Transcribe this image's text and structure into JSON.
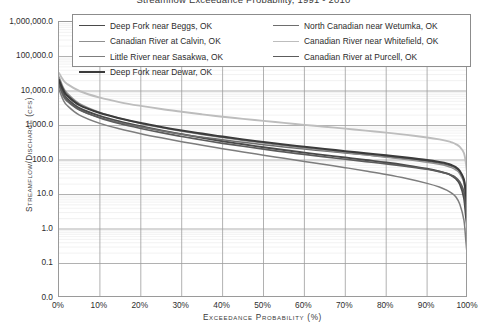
{
  "chart_data": {
    "type": "line",
    "title": "Streamflow Exceedance Probability, 1991 - 2010",
    "xlabel": "Exceedance Probability (%)",
    "ylabel": "Streamflow/Discharge (cfs)",
    "yscale": "log",
    "ylim": [
      0.0,
      1000000.0
    ],
    "xlim": [
      0,
      100
    ],
    "grid": true,
    "legend_position": "top-inside",
    "ytick_labels": [
      "1,000,000.0",
      "100,000.0",
      "10,000.0",
      "1,000.0",
      "100.0",
      "10.0",
      "1.0",
      "0.1",
      "0.0"
    ],
    "ytick_values": [
      1000000.0,
      100000.0,
      10000.0,
      1000.0,
      100.0,
      10.0,
      1.0,
      0.1,
      0.0
    ],
    "xtick_labels": [
      "0%",
      "10%",
      "20%",
      "30%",
      "40%",
      "50%",
      "60%",
      "70%",
      "80%",
      "90%",
      "100%"
    ],
    "xtick_values": [
      0,
      10,
      20,
      30,
      40,
      50,
      60,
      70,
      80,
      90,
      100
    ],
    "x": [
      0,
      1,
      2,
      5,
      10,
      15,
      20,
      25,
      30,
      35,
      40,
      45,
      50,
      55,
      60,
      65,
      70,
      75,
      80,
      85,
      90,
      93,
      95,
      96,
      97,
      98,
      99,
      99.5,
      100
    ],
    "series": [
      {
        "name": "Deep Fork near Beggs, OK",
        "color": "#4a4a4a",
        "width": 1.9,
        "values": [
          18000,
          9000,
          6000,
          3200,
          1900,
          1300,
          950,
          720,
          560,
          440,
          350,
          285,
          235,
          195,
          163,
          138,
          118,
          100,
          85,
          70,
          56,
          47,
          40,
          35,
          29,
          20,
          8,
          2.2,
          0.7
        ]
      },
      {
        "name": "North Canadian near Wetumka, OK",
        "color": "#6e6e6e",
        "width": 1.5,
        "values": [
          14000,
          7200,
          5000,
          2800,
          1700,
          1200,
          900,
          700,
          560,
          460,
          385,
          325,
          278,
          240,
          208,
          182,
          160,
          141,
          124,
          108,
          92,
          81,
          72,
          66,
          58,
          45,
          26,
          11,
          3.0
        ]
      },
      {
        "name": "Canadian River at Calvin, OK",
        "color": "#8f8f8f",
        "width": 1.5,
        "values": [
          26000,
          13000,
          8600,
          4300,
          2400,
          1600,
          1150,
          870,
          680,
          545,
          445,
          370,
          310,
          262,
          223,
          191,
          164,
          141,
          121,
          103,
          86,
          75,
          66,
          60,
          52,
          40,
          22,
          8,
          1.6
        ]
      },
      {
        "name": "Canadian River near Whitefield, OK",
        "color": "#bdbdbd",
        "width": 1.9,
        "values": [
          33000,
          21000,
          16000,
          10000,
          6400,
          4700,
          3700,
          3000,
          2500,
          2100,
          1800,
          1560,
          1360,
          1190,
          1045,
          920,
          810,
          710,
          620,
          535,
          450,
          395,
          352,
          325,
          290,
          240,
          160,
          78,
          22
        ]
      },
      {
        "name": "Little River near Sasakwa, OK",
        "color": "#7d7d7d",
        "width": 1.5,
        "values": [
          11000,
          5600,
          3800,
          2000,
          1150,
          790,
          580,
          440,
          340,
          268,
          213,
          171,
          138,
          112,
          91,
          74,
          60,
          48,
          38,
          29,
          21,
          16.5,
          13,
          11,
          8.6,
          5.2,
          1.8,
          0.42,
          0.09
        ]
      },
      {
        "name": "Canadian River at Purcell, OK",
        "color": "#5c5c5c",
        "width": 1.7,
        "values": [
          16000,
          8200,
          5500,
          2900,
          1650,
          1120,
          820,
          620,
          480,
          380,
          305,
          250,
          206,
          172,
          145,
          123,
          105,
          90,
          77,
          65,
          54,
          46,
          40,
          36,
          31,
          23,
          12,
          4.0,
          1.0
        ]
      },
      {
        "name": "Deep Fork near Dewar, OK",
        "color": "#3b3b3b",
        "width": 2.1,
        "values": [
          21000,
          11000,
          7400,
          3900,
          2300,
          1600,
          1180,
          910,
          720,
          580,
          475,
          395,
          332,
          282,
          241,
          208,
          180,
          156,
          136,
          117,
          99,
          87,
          78,
          71,
          62,
          48,
          27,
          10,
          2.5
        ]
      }
    ]
  },
  "legend": {
    "left_items": [
      {
        "label": "Deep Fork near Beggs, OK",
        "color": "#4a4a4a",
        "width": "1.9px"
      },
      {
        "label": "Canadian River at Calvin, OK",
        "color": "#8f8f8f",
        "width": "1.5px"
      },
      {
        "label": "Little River near Sasakwa, OK",
        "color": "#7d7d7d",
        "width": "1.5px"
      },
      {
        "label": "Deep Fork near Dewar, OK",
        "color": "#3b3b3b",
        "width": "2.1px"
      }
    ],
    "right_items": [
      {
        "label": "North Canadian near Wetumka, OK",
        "color": "#6e6e6e",
        "width": "1.5px"
      },
      {
        "label": "Canadian River near Whitefield, OK",
        "color": "#bdbdbd",
        "width": "1.9px"
      },
      {
        "label": "Canadian River at Purcell, OK",
        "color": "#5c5c5c",
        "width": "1.7px"
      }
    ]
  },
  "axes": {
    "title": "Streamflow Exceedance Probability, 1991 - 2010",
    "y_title": "Streamflow/Discharge (cfs)",
    "x_title": "Exceedance Probability (%)"
  },
  "colors": {
    "frame": "#9a9a9a",
    "major_grid": "#9d9d9d",
    "minor_grid": "#e9e9e9",
    "background": "#ffffff",
    "text": "#2e2e2e"
  }
}
